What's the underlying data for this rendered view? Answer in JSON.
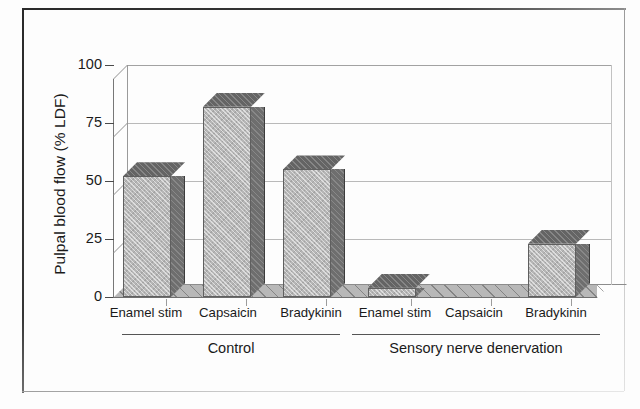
{
  "chart_data": {
    "type": "bar",
    "title": "",
    "xlabel": "",
    "ylabel": "Pulpal blood flow (% LDF)",
    "ylim": [
      0,
      100
    ],
    "yticks": [
      "0",
      "25",
      "50",
      "75",
      "100"
    ],
    "ytick_values": [
      0,
      25,
      50,
      75,
      100
    ],
    "grid": true,
    "legend": "none",
    "style": "3d-bar",
    "categories": [
      "Enamel stim",
      "Capsaicin",
      "Bradykinin",
      "Enamel stim",
      "Capsaicin",
      "Bradykinin"
    ],
    "values": [
      52,
      82,
      55,
      4,
      0,
      23
    ],
    "groups": [
      {
        "label": "Control",
        "categories": [
          "Enamel stim",
          "Capsaicin",
          "Bradykinin"
        ],
        "values": [
          52,
          82,
          55
        ]
      },
      {
        "label": "Sensory nerve denervation",
        "categories": [
          "Enamel stim",
          "Capsaicin",
          "Bradykinin"
        ],
        "values": [
          4,
          0,
          23
        ]
      }
    ],
    "colors": {
      "bar_front": "#b6b6b6",
      "bar_side": "#6e6e6e",
      "bar_top": "#646464",
      "gridline": "#b9b9b9",
      "axis": "#4a4a4a",
      "text": "#1a1a1a",
      "background": "#ffffff",
      "frame": "#2a2a2a"
    }
  },
  "axis": {
    "y_title": "Pulpal blood flow (% LDF)",
    "ticks": [
      {
        "label": "100",
        "value": 100
      },
      {
        "label": "75",
        "value": 75
      },
      {
        "label": "50",
        "value": 50
      },
      {
        "label": "25",
        "value": 25
      },
      {
        "label": "0",
        "value": 0
      }
    ]
  },
  "categories": [
    {
      "label": "Enamel stim",
      "value": 52
    },
    {
      "label": "Capsaicin",
      "value": 82
    },
    {
      "label": "Bradykinin",
      "value": 55
    },
    {
      "label": "Enamel stim",
      "value": 4
    },
    {
      "label": "Capsaicin",
      "value": 0
    },
    {
      "label": "Bradykinin",
      "value": 23
    }
  ],
  "groups": [
    {
      "label": "Control"
    },
    {
      "label": "Sensory nerve denervation"
    }
  ]
}
